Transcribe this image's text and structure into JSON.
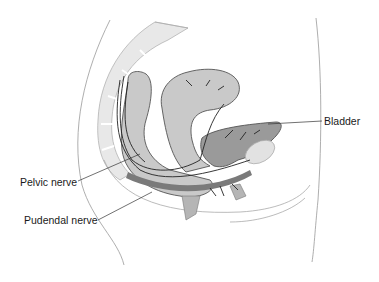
{
  "diagram": {
    "type": "anatomical-illustration",
    "labels": {
      "bladder": "Bladder",
      "pelvic_nerve": "Pelvic nerve",
      "pudendal_nerve": "Pudendal nerve"
    },
    "colors": {
      "background": "#ffffff",
      "organ_light": "#c9c9c9",
      "organ_dark": "#9a9a9a",
      "bone": "#e6e6e6",
      "outline": "#555555",
      "nerve": "#222222",
      "band": "#7a7a7a"
    }
  }
}
